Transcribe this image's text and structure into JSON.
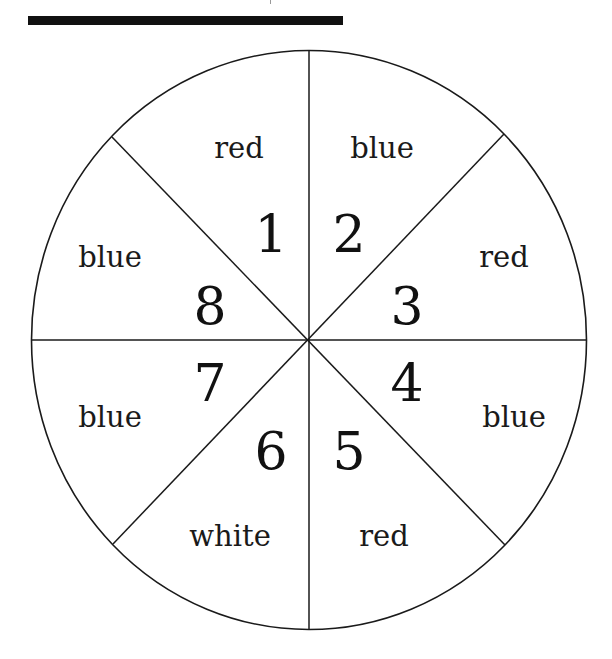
{
  "figure": {
    "type": "spinner",
    "segments": [
      {
        "number": "1",
        "color_label": "red"
      },
      {
        "number": "2",
        "color_label": "blue"
      },
      {
        "number": "3",
        "color_label": "red"
      },
      {
        "number": "4",
        "color_label": "blue"
      },
      {
        "number": "5",
        "color_label": "red"
      },
      {
        "number": "6",
        "color_label": "white"
      },
      {
        "number": "7",
        "color_label": "blue"
      },
      {
        "number": "8",
        "color_label": "blue"
      }
    ]
  }
}
